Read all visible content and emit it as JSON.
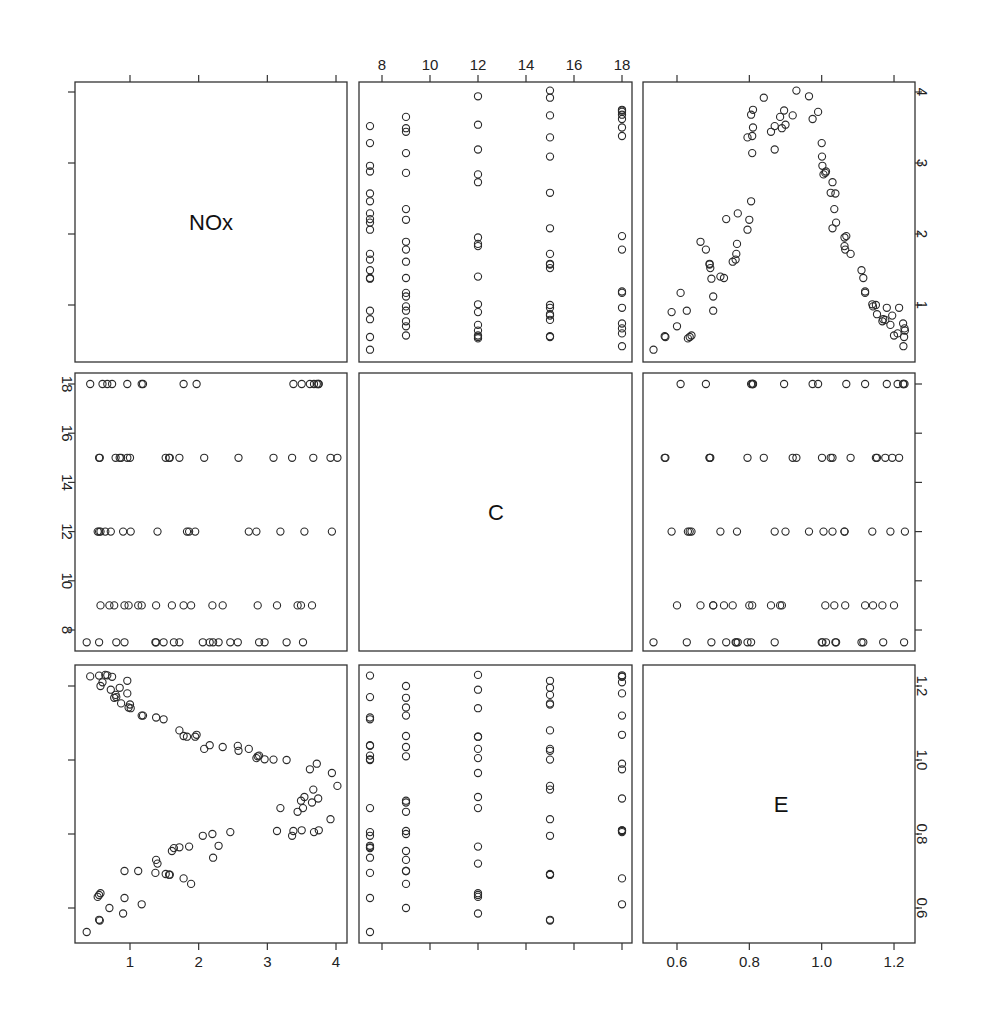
{
  "chart_data": {
    "type": "scatter",
    "title": "",
    "layout": "scatterplot-matrix",
    "variables": [
      "NOx",
      "C",
      "E"
    ],
    "diagonal_labels": [
      "NOx",
      "C",
      "E"
    ],
    "axes": {
      "NOx": {
        "ticks": [
          1,
          2,
          3,
          4
        ],
        "tick_labels": [
          "1",
          "2",
          "3",
          "4"
        ],
        "range": [
          0.37,
          4.1
        ]
      },
      "C": {
        "ticks": [
          8,
          10,
          12,
          14,
          16,
          18
        ],
        "tick_labels": [
          "8",
          "10",
          "12",
          "14",
          "16",
          "18"
        ],
        "range": [
          7.0,
          18.4
        ]
      },
      "E": {
        "ticks": [
          0.6,
          0.8,
          1.0,
          1.2
        ],
        "tick_labels": [
          "0.6",
          "0.8",
          "1.0",
          "1.2"
        ],
        "range": [
          0.52,
          1.25
        ]
      }
    },
    "axis_label_placement": {
      "top": [
        "",
        "C",
        ""
      ],
      "right": [
        "NOx",
        "",
        "E"
      ],
      "left": [
        "",
        "C",
        ""
      ],
      "bottom": [
        "NOx",
        "",
        "E"
      ]
    },
    "grid": false,
    "legend": null,
    "points": [
      {
        "NOx": 0.37,
        "C": 7.5,
        "E": 0.535
      },
      {
        "NOx": 0.55,
        "C": 15.0,
        "E": 0.568
      },
      {
        "NOx": 0.56,
        "C": 15.0,
        "E": 0.566
      },
      {
        "NOx": 0.7,
        "C": 9.0,
        "E": 0.6
      },
      {
        "NOx": 0.92,
        "C": 7.5,
        "E": 0.627
      },
      {
        "NOx": 1.17,
        "C": 18.0,
        "E": 0.61
      },
      {
        "NOx": 0.9,
        "C": 12.0,
        "E": 0.585
      },
      {
        "NOx": 0.53,
        "C": 12.0,
        "E": 0.63
      },
      {
        "NOx": 0.55,
        "C": 12.0,
        "E": 0.635
      },
      {
        "NOx": 0.57,
        "C": 12.0,
        "E": 0.64
      },
      {
        "NOx": 1.89,
        "C": 9.0,
        "E": 0.665
      },
      {
        "NOx": 1.78,
        "C": 18.0,
        "E": 0.68
      },
      {
        "NOx": 1.57,
        "C": 15.0,
        "E": 0.69
      },
      {
        "NOx": 1.58,
        "C": 15.0,
        "E": 0.69
      },
      {
        "NOx": 1.52,
        "C": 15.0,
        "E": 0.692
      },
      {
        "NOx": 1.37,
        "C": 7.5,
        "E": 0.695
      },
      {
        "NOx": 0.92,
        "C": 9.0,
        "E": 0.7
      },
      {
        "NOx": 1.12,
        "C": 9.0,
        "E": 0.7
      },
      {
        "NOx": 1.4,
        "C": 12.0,
        "E": 0.72
      },
      {
        "NOx": 1.38,
        "C": 9.0,
        "E": 0.73
      },
      {
        "NOx": 2.21,
        "C": 7.5,
        "E": 0.736
      },
      {
        "NOx": 1.61,
        "C": 9.0,
        "E": 0.754
      },
      {
        "NOx": 1.64,
        "C": 7.5,
        "E": 0.762
      },
      {
        "NOx": 1.72,
        "C": 7.5,
        "E": 0.764
      },
      {
        "NOx": 1.86,
        "C": 12.0,
        "E": 0.766
      },
      {
        "NOx": 2.29,
        "C": 7.5,
        "E": 0.768
      },
      {
        "NOx": 2.06,
        "C": 7.5,
        "E": 0.795
      },
      {
        "NOx": 2.2,
        "C": 9.0,
        "E": 0.8
      },
      {
        "NOx": 2.46,
        "C": 7.5,
        "E": 0.805
      },
      {
        "NOx": 3.14,
        "C": 9.0,
        "E": 0.808
      },
      {
        "NOx": 3.38,
        "C": 18.0,
        "E": 0.808
      },
      {
        "NOx": 3.5,
        "C": 18.0,
        "E": 0.81
      },
      {
        "NOx": 3.68,
        "C": 18.0,
        "E": 0.805
      },
      {
        "NOx": 3.75,
        "C": 18.0,
        "E": 0.81
      },
      {
        "NOx": 3.36,
        "C": 15.0,
        "E": 0.795
      },
      {
        "NOx": 3.92,
        "C": 15.0,
        "E": 0.84
      },
      {
        "NOx": 3.19,
        "C": 12.0,
        "E": 0.87
      },
      {
        "NOx": 3.44,
        "C": 9.0,
        "E": 0.86
      },
      {
        "NOx": 3.52,
        "C": 7.5,
        "E": 0.87
      },
      {
        "NOx": 3.65,
        "C": 9.0,
        "E": 0.885
      },
      {
        "NOx": 3.49,
        "C": 9.0,
        "E": 0.89
      },
      {
        "NOx": 3.54,
        "C": 12.0,
        "E": 0.9
      },
      {
        "NOx": 3.74,
        "C": 18.0,
        "E": 0.896
      },
      {
        "NOx": 3.67,
        "C": 15.0,
        "E": 0.92
      },
      {
        "NOx": 4.02,
        "C": 15.0,
        "E": 0.93
      },
      {
        "NOx": 3.94,
        "C": 12.0,
        "E": 0.965
      },
      {
        "NOx": 3.62,
        "C": 18.0,
        "E": 0.975
      },
      {
        "NOx": 3.72,
        "C": 18.0,
        "E": 0.99
      },
      {
        "NOx": 3.28,
        "C": 7.5,
        "E": 1.0
      },
      {
        "NOx": 3.09,
        "C": 15.0,
        "E": 1.001
      },
      {
        "NOx": 2.96,
        "C": 7.5,
        "E": 1.002
      },
      {
        "NOx": 2.84,
        "C": 12.0,
        "E": 1.005
      },
      {
        "NOx": 2.86,
        "C": 9.0,
        "E": 1.01
      },
      {
        "NOx": 2.88,
        "C": 7.5,
        "E": 1.012
      },
      {
        "NOx": 2.73,
        "C": 12.0,
        "E": 1.03
      },
      {
        "NOx": 2.58,
        "C": 15.0,
        "E": 1.025
      },
      {
        "NOx": 2.57,
        "C": 7.5,
        "E": 1.038
      },
      {
        "NOx": 2.35,
        "C": 9.0,
        "E": 1.035
      },
      {
        "NOx": 2.16,
        "C": 7.5,
        "E": 1.04
      },
      {
        "NOx": 2.08,
        "C": 15.0,
        "E": 1.03
      },
      {
        "NOx": 1.95,
        "C": 12.0,
        "E": 1.063
      },
      {
        "NOx": 1.97,
        "C": 18.0,
        "E": 1.068
      },
      {
        "NOx": 1.83,
        "C": 12.0,
        "E": 1.063
      },
      {
        "NOx": 1.78,
        "C": 9.0,
        "E": 1.065
      },
      {
        "NOx": 1.72,
        "C": 15.0,
        "E": 1.08
      },
      {
        "NOx": 1.49,
        "C": 7.5,
        "E": 1.11
      },
      {
        "NOx": 1.38,
        "C": 7.5,
        "E": 1.115
      },
      {
        "NOx": 1.19,
        "C": 18.0,
        "E": 1.12
      },
      {
        "NOx": 1.17,
        "C": 9.0,
        "E": 1.12
      },
      {
        "NOx": 1.01,
        "C": 12.0,
        "E": 1.14
      },
      {
        "NOx": 0.98,
        "C": 9.0,
        "E": 1.142
      },
      {
        "NOx": 1.0,
        "C": 15.0,
        "E": 1.15
      },
      {
        "NOx": 0.87,
        "C": 15.0,
        "E": 1.153
      },
      {
        "NOx": 0.96,
        "C": 18.0,
        "E": 1.18
      },
      {
        "NOx": 0.77,
        "C": 9.0,
        "E": 1.168
      },
      {
        "NOx": 0.8,
        "C": 7.5,
        "E": 1.17
      },
      {
        "NOx": 0.79,
        "C": 15.0,
        "E": 1.176
      },
      {
        "NOx": 0.72,
        "C": 12.0,
        "E": 1.19
      },
      {
        "NOx": 0.57,
        "C": 9.0,
        "E": 1.2
      },
      {
        "NOx": 0.6,
        "C": 18.0,
        "E": 1.21
      },
      {
        "NOx": 0.96,
        "C": 15.0,
        "E": 1.214
      },
      {
        "NOx": 0.42,
        "C": 18.0,
        "E": 1.226
      },
      {
        "NOx": 0.55,
        "C": 7.5,
        "E": 1.228
      },
      {
        "NOx": 0.64,
        "C": 12.0,
        "E": 1.23
      },
      {
        "NOx": 0.67,
        "C": 18.0,
        "E": 1.229
      },
      {
        "NOx": 0.74,
        "C": 18.0,
        "E": 1.225
      },
      {
        "NOx": 0.85,
        "C": 15.0,
        "E": 1.195
      }
    ]
  }
}
